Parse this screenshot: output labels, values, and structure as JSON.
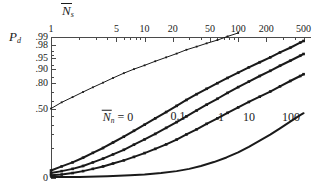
{
  "figure": {
    "background_color": "#ffffff",
    "ink_color": "#1a1a1a",
    "axis_color": "#4a4a4a"
  },
  "chart_data": {
    "type": "line",
    "title": "",
    "subtitle": "",
    "xlabel": "N̅ₛ",
    "xlabel_parts": {
      "symbol": "N",
      "overbar": true,
      "subscript": "s"
    },
    "ylabel": "Pₔ",
    "ylabel_parts": {
      "symbol": "P",
      "subscript": "d"
    },
    "xscale": "log",
    "xlim": [
      1,
      600
    ],
    "xticks": [
      1,
      5,
      10,
      20,
      50,
      100,
      200,
      500
    ],
    "xtick_labels": [
      "1",
      "5",
      "10",
      "20",
      "50",
      "100",
      "200",
      "500"
    ],
    "x_minor_ticks": [
      2,
      3,
      4,
      6,
      7,
      8,
      9,
      30,
      40,
      60,
      70,
      80,
      90,
      300,
      400
    ],
    "yscale": "probability",
    "ylim": [
      0,
      0.99
    ],
    "yticks": [
      0,
      0.5,
      0.8,
      0.9,
      0.95,
      0.98,
      0.99
    ],
    "ytick_labels": [
      "0",
      ".50",
      ".80",
      ".90",
      ".95",
      ".98",
      ".99"
    ],
    "y_minor_ticks": [
      0.1,
      0.2,
      0.3,
      0.4,
      0.6,
      0.7,
      0.85,
      0.92,
      0.96,
      0.97
    ],
    "grid": false,
    "legend_position": "inline-annotations",
    "series_parameter_label": "N̅ₙ",
    "series_parameter_parts": {
      "symbol": "N",
      "overbar": true,
      "subscript": "n"
    },
    "series": [
      {
        "name": "0",
        "label": "0",
        "marker": "dotted",
        "linewidth": 1,
        "x": [
          1,
          1.3,
          1.7,
          2.2,
          2.8,
          3.6,
          4.6,
          6,
          7.7,
          10,
          13,
          17,
          22,
          28,
          36,
          46,
          60,
          77,
          100,
          115
        ],
        "y": [
          0.5,
          0.58,
          0.645,
          0.705,
          0.755,
          0.8,
          0.84,
          0.875,
          0.9,
          0.92,
          0.938,
          0.952,
          0.963,
          0.972,
          0.978,
          0.983,
          0.987,
          0.9905,
          0.993,
          0.9945
        ]
      },
      {
        "name": "0.1",
        "label": "0.1",
        "marker": "dotted",
        "linewidth": 2,
        "x": [
          1,
          1.3,
          1.7,
          2.2,
          2.8,
          3.6,
          4.6,
          6,
          7.7,
          10,
          13,
          17,
          22,
          28,
          36,
          46,
          60,
          77,
          100,
          130,
          170,
          220,
          280,
          360,
          460,
          500
        ],
        "y": [
          0.022,
          0.03,
          0.04,
          0.055,
          0.075,
          0.1,
          0.135,
          0.18,
          0.235,
          0.3,
          0.375,
          0.455,
          0.535,
          0.61,
          0.68,
          0.74,
          0.795,
          0.84,
          0.878,
          0.91,
          0.934,
          0.952,
          0.966,
          0.976,
          0.984,
          0.986
        ]
      },
      {
        "name": "1",
        "label": "1",
        "marker": "dotted",
        "linewidth": 2,
        "x": [
          1,
          1.3,
          1.7,
          2.2,
          2.8,
          3.6,
          4.6,
          6,
          7.7,
          10,
          13,
          17,
          22,
          28,
          36,
          46,
          60,
          77,
          100,
          130,
          170,
          220,
          280,
          360,
          460,
          500
        ],
        "y": [
          0.018,
          0.021,
          0.025,
          0.031,
          0.04,
          0.052,
          0.068,
          0.09,
          0.12,
          0.158,
          0.205,
          0.265,
          0.33,
          0.4,
          0.475,
          0.55,
          0.625,
          0.695,
          0.757,
          0.81,
          0.855,
          0.89,
          0.918,
          0.94,
          0.957,
          0.962
        ]
      },
      {
        "name": "10",
        "label": "10",
        "marker": "dotted",
        "linewidth": 2,
        "x": [
          1,
          1.3,
          1.7,
          2.2,
          2.8,
          3.6,
          4.6,
          6,
          7.7,
          10,
          13,
          17,
          22,
          28,
          36,
          46,
          60,
          77,
          100,
          130,
          170,
          220,
          280,
          360,
          460,
          500
        ],
        "y": [
          0.015,
          0.016,
          0.018,
          0.021,
          0.025,
          0.03,
          0.037,
          0.046,
          0.058,
          0.074,
          0.095,
          0.122,
          0.157,
          0.2,
          0.25,
          0.31,
          0.375,
          0.445,
          0.515,
          0.585,
          0.65,
          0.71,
          0.765,
          0.815,
          0.855,
          0.868
        ]
      },
      {
        "name": "100",
        "label": "100",
        "marker": "solid",
        "linewidth": 2,
        "x": [
          1,
          2,
          4,
          7,
          10,
          15,
          22,
          30,
          40,
          55,
          75,
          100,
          130,
          170,
          220,
          280,
          360,
          460,
          500
        ],
        "y": [
          0.013,
          0.013,
          0.014,
          0.015,
          0.016,
          0.018,
          0.021,
          0.025,
          0.031,
          0.041,
          0.056,
          0.077,
          0.107,
          0.148,
          0.198,
          0.26,
          0.335,
          0.415,
          0.44
        ]
      }
    ],
    "annotations": [
      {
        "text": "= 0",
        "series": "0",
        "x_px": 118,
        "y_px": 117
      },
      {
        "text": "0.1",
        "series": "0.1",
        "x_px": 178,
        "y_px": 116
      },
      {
        "text": "1",
        "series": "1",
        "x_px": 221,
        "y_px": 117
      },
      {
        "text": "10",
        "series": "10",
        "x_px": 249,
        "y_px": 117
      },
      {
        "text": "100",
        "series": "100",
        "x_px": 291,
        "y_px": 117
      }
    ]
  }
}
